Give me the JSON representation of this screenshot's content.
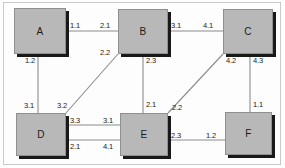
{
  "diagram": {
    "background_color": "#fdfdfd",
    "node_fill_color": "#b8b8b8",
    "node_border_color": "#8f8f8f",
    "node_shadow_color": "#191919",
    "edge_color": "#8c8c8c",
    "label_color": "#1c1c1c",
    "nodes": [
      {
        "id": "A",
        "label": "A",
        "x": 14,
        "y": 8,
        "w": 52,
        "h": 46
      },
      {
        "id": "B",
        "label": "B",
        "x": 118,
        "y": 9,
        "w": 50,
        "h": 45
      },
      {
        "id": "C",
        "label": "C",
        "x": 223,
        "y": 9,
        "w": 50,
        "h": 45
      },
      {
        "id": "D",
        "label": "D",
        "x": 16,
        "y": 113,
        "w": 50,
        "h": 43
      },
      {
        "id": "E",
        "label": "E",
        "x": 120,
        "y": 113,
        "w": 48,
        "h": 43
      },
      {
        "id": "F",
        "label": "F",
        "x": 225,
        "y": 112,
        "w": 47,
        "h": 43
      }
    ],
    "edges": [
      {
        "id": "a-b",
        "from": "A",
        "to": "B",
        "kind": "horizontal",
        "from_port": "1.1",
        "to_port": "2.1"
      },
      {
        "id": "b-c",
        "from": "B",
        "to": "C",
        "kind": "horizontal",
        "from_port": "3.1",
        "to_port": "4.1"
      },
      {
        "id": "a-d",
        "from": "A",
        "to": "D",
        "kind": "vertical",
        "from_port": "1.2",
        "to_port": "3.1"
      },
      {
        "id": "b-e",
        "from": "B",
        "to": "E",
        "kind": "vertical",
        "from_port": "2.3",
        "to_port": "2.1"
      },
      {
        "id": "c-f",
        "from": "C",
        "to": "F",
        "kind": "vertical",
        "from_port": "4.3",
        "to_port": "1.1"
      },
      {
        "id": "d-b",
        "from": "D",
        "to": "B",
        "kind": "diagonal",
        "from_port": "3.2",
        "to_port": "2.2"
      },
      {
        "id": "e-c",
        "from": "E",
        "to": "C",
        "kind": "diagonal",
        "from_port": "2.2",
        "to_port": "4.2"
      },
      {
        "id": "d-e-1",
        "from": "D",
        "to": "E",
        "kind": "horizontal",
        "from_port": "3.3",
        "to_port": "3.1"
      },
      {
        "id": "d-e-2",
        "from": "D",
        "to": "E",
        "kind": "horizontal",
        "from_port": "2.1",
        "to_port": "4.1"
      },
      {
        "id": "e-f",
        "from": "E",
        "to": "F",
        "kind": "horizontal",
        "from_port": "2.3",
        "to_port": "1.2"
      }
    ],
    "labels": {
      "ab_left": "1.1",
      "ab_right": "2.1",
      "bc_left": "3.1",
      "bc_right": "4.1",
      "ad_top": "1.2",
      "ad_bottom": "3.1",
      "be_top": "2.3",
      "be_bottom": "2.1",
      "cf_top": "4.3",
      "cf_bottom": "1.1",
      "db_bottom": "3.2",
      "db_top": "2.2",
      "ec_bottom": "2.2",
      "ec_top": "4.2",
      "de1_left": "3.3",
      "de1_right": "3.1",
      "de2_left": "2.1",
      "de2_right": "4.1",
      "ef_left": "2.3",
      "ef_right": "1.2"
    }
  }
}
